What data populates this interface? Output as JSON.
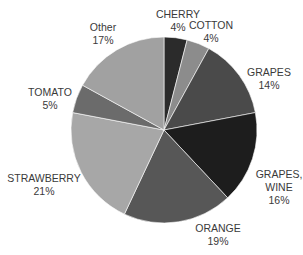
{
  "chart_data": {
    "type": "pie",
    "title": "",
    "start_angle_deg": 0,
    "direction": "clockwise",
    "center": [
      164,
      130
    ],
    "radius": 93,
    "slices": [
      {
        "label": "CHERRY",
        "value": 4,
        "pct_label": "4%",
        "color": "#2b2b2b"
      },
      {
        "label": "COTTON",
        "value": 4,
        "pct_label": "4%",
        "color": "#8c8c8c"
      },
      {
        "label": "GRAPES",
        "value": 14,
        "pct_label": "14%",
        "color": "#4a4a4a"
      },
      {
        "label": "GRAPES, WINE",
        "value": 16,
        "pct_label": "16%",
        "color": "#1d1d1d"
      },
      {
        "label": "ORANGE",
        "value": 19,
        "pct_label": "19%",
        "color": "#575757"
      },
      {
        "label": "STRAWBERRY",
        "value": 21,
        "pct_label": "21%",
        "color": "#a7a7a7"
      },
      {
        "label": "TOMATO",
        "value": 5,
        "pct_label": "5%",
        "color": "#6b6b6b"
      },
      {
        "label": "Other",
        "value": 17,
        "pct_label": "17%",
        "color": "#a1a1a1"
      }
    ],
    "categories": [
      "CHERRY",
      "COTTON",
      "GRAPES",
      "GRAPES, WINE",
      "ORANGE",
      "STRAWBERRY",
      "TOMATO",
      "Other"
    ],
    "values": [
      4,
      4,
      14,
      16,
      19,
      21,
      5,
      17
    ],
    "legend": "none (data labels outside slices)"
  },
  "labels": [
    {
      "line1": "CHERRY",
      "line2": "4%",
      "x": 178,
      "y": 8
    },
    {
      "line1": "COTTON",
      "line2": "4%",
      "x": 211,
      "y": 19
    },
    {
      "line1": "GRAPES",
      "line2": "14%",
      "x": 268,
      "y": 68
    },
    {
      "line1": "GRAPES,",
      "line1b": "WINE",
      "line2": "16%",
      "x": 279,
      "y": 172
    },
    {
      "line1": "ORANGE",
      "line2": "19%",
      "x": 217,
      "y": 222
    },
    {
      "line1": "STRAWBERRY",
      "line2": "21%",
      "x": 44,
      "y": 173
    },
    {
      "line1": "TOMATO",
      "line2": "5%",
      "x": 50,
      "y": 88
    },
    {
      "line1": "Other",
      "line2": "17%",
      "x": 102,
      "y": 22
    }
  ]
}
